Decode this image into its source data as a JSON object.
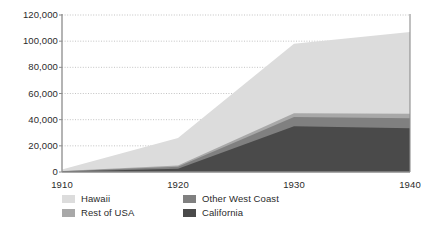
{
  "chart_data": {
    "type": "area",
    "title": "",
    "subtitle": "",
    "xlabel": "",
    "ylabel": "",
    "stacked": true,
    "grid": true,
    "grid_style": "dotted-horizontal",
    "legend_position": "bottom",
    "x": [
      1910,
      1920,
      1930,
      1940
    ],
    "categories": [
      "1910",
      "1920",
      "1930",
      "1940"
    ],
    "xlim": [
      1910,
      1940
    ],
    "ylim": [
      0,
      120000
    ],
    "y_ticks": [
      0,
      20000,
      40000,
      60000,
      80000,
      100000,
      120000
    ],
    "y_tick_labels": [
      "0",
      "20,000",
      "40,000",
      "60,000",
      "80,000",
      "100,000",
      "120,000"
    ],
    "x_ticks": [
      1910,
      1920,
      1930,
      1940
    ],
    "x_tick_labels": [
      "1910",
      "1920",
      "1930",
      "1940"
    ],
    "stack_order_bottom_to_top": [
      "California",
      "Other West Coast",
      "Rest of USA",
      "Hawaii"
    ],
    "series": [
      {
        "name": "California",
        "color": "#4a4a4a",
        "values": [
          400,
          2500,
          35000,
          33500
        ]
      },
      {
        "name": "Other West Coast",
        "color": "#808080",
        "values": [
          200,
          1500,
          7000,
          7500
        ]
      },
      {
        "name": "Rest of USA",
        "color": "#a8a8a8",
        "values": [
          150,
          1000,
          3000,
          3500
        ]
      },
      {
        "name": "Hawaii",
        "color": "#dcdcdc",
        "values": [
          1250,
          21000,
          53000,
          62500
        ]
      }
    ],
    "totals": [
      2000,
      26000,
      98000,
      107000
    ]
  },
  "legend": {
    "items": [
      {
        "label": "Hawaii",
        "color": "#dcdcdc"
      },
      {
        "label": "Rest of USA",
        "color": "#a8a8a8"
      },
      {
        "label": "Other West Coast",
        "color": "#808080"
      },
      {
        "label": "California",
        "color": "#4a4a4a"
      }
    ]
  },
  "axes": {
    "axis_color": "#8c8c8c",
    "grid_color": "#b4b4b4",
    "text_color": "#2b2b2b"
  }
}
